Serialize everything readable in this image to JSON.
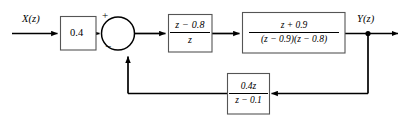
{
  "diagram": {
    "type": "control-system-block-diagram",
    "domain": "z-domain discrete-time feedback system",
    "background_color": "#ffffff",
    "line_color": "#000000",
    "block_border_color": "#555555",
    "canvas": {
      "width": 410,
      "height": 124
    }
  },
  "signals": {
    "input_label": "X(z)",
    "output_label": "Y(z)"
  },
  "summing_junction": {
    "name": "summing-junction",
    "shape": "circle",
    "input_sign_top": "+",
    "input_sign_bottom": "−"
  },
  "blocks": {
    "gain": {
      "name": "gain-block",
      "value": "0.4"
    },
    "compensator": {
      "name": "compensator-block",
      "numerator": "z − 0.8",
      "denominator": "z"
    },
    "plant": {
      "name": "plant-block",
      "numerator": "z + 0.9",
      "denominator": "(z − 0.9)(z − 0.8)"
    },
    "feedback": {
      "name": "feedback-block",
      "numerator": "0.4z",
      "denominator": "z − 0.1"
    }
  },
  "connections": {
    "input_arrow": "X(z) to gain block",
    "gain_to_sum": "gain block to summing junction positive input",
    "sum_to_compensator": "summing junction to compensator block",
    "compensator_to_plant": "compensator block to plant block",
    "plant_to_output": "plant block to Y(z) output with takeoff node",
    "takeoff_to_feedback": "Y(z) takeoff node down and left into feedback block",
    "feedback_to_sum": "feedback block left then up into summing junction negative input"
  }
}
